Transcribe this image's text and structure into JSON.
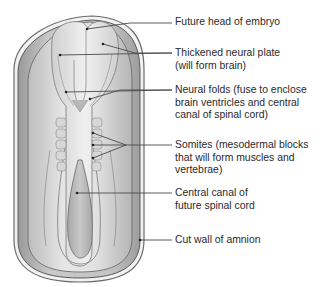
{
  "labels": [
    {
      "id": "future-head",
      "lines": [
        "Future head of embryo"
      ],
      "top": 16
    },
    {
      "id": "neural-plate",
      "lines": [
        "Thickened neural plate",
        "(will form brain)"
      ],
      "top": 47
    },
    {
      "id": "neural-folds",
      "lines": [
        "Neural folds (fuse to enclose",
        "brain ventricles and central",
        "canal of spinal cord)"
      ],
      "top": 84
    },
    {
      "id": "somites",
      "lines": [
        "Somites (mesodermal blocks",
        "that will form muscles and",
        "vertebrae)"
      ],
      "top": 139
    },
    {
      "id": "central-canal",
      "lines": [
        "Central canal of",
        "future spinal cord"
      ],
      "top": 187
    },
    {
      "id": "amnion",
      "lines": [
        "Cut wall of amnion"
      ],
      "top": 234
    }
  ],
  "colors": {
    "leader": "#4a4a4a",
    "text": "#2a2a2a",
    "outline": "#555555"
  }
}
